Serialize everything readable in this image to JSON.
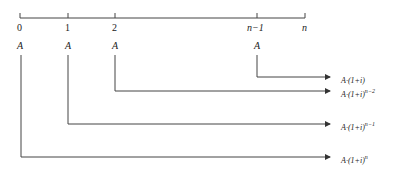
{
  "timeline": {
    "ticks": [
      {
        "label": "0",
        "x": 20
      },
      {
        "label": "1",
        "x": 68
      },
      {
        "label": "2",
        "x": 115
      },
      {
        "label": "n−1",
        "x": 257
      },
      {
        "label": "n",
        "x": 304
      }
    ]
  },
  "payments": [
    {
      "tick": "0",
      "label": "A"
    },
    {
      "tick": "1",
      "label": "A"
    },
    {
      "tick": "2",
      "label": "A"
    },
    {
      "tick": "n−1",
      "label": "A"
    }
  ],
  "results": [
    {
      "from": "n−1",
      "base": "A·(1+i)",
      "exp": ""
    },
    {
      "from": "2",
      "base": "A·(1+i)",
      "exp": "n−2"
    },
    {
      "from": "1",
      "base": "A·(1+i)",
      "exp": "n−1"
    },
    {
      "from": "0",
      "base": "A·(1+i)",
      "exp": "n"
    }
  ]
}
